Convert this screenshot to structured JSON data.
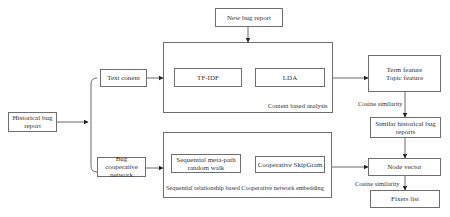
{
  "diagram": {
    "nodes": {
      "new_bug_report": "New bug report",
      "historical_bug_report": "Historical bug report",
      "text_content": "Text conent",
      "bug_cooperative_network": "Bug cooperative network",
      "tf_idf": "TF-IDF",
      "lda": "LDA",
      "sequential_meta_path": "Sequential meta-path random walk",
      "cooperative_skipgram": "Cooperative SkipGram",
      "term_feature": "Term feature",
      "topic_feature": "Topic feature",
      "similar_historical_bug_reports": "Similar historical bug reports",
      "node_vector": "Node vector",
      "fixers_list": "Fixers list"
    },
    "groups": {
      "content_based_analysis": "Content based analysis",
      "sequential_embedding": "Sequential relationship based Cooperative network embedding"
    },
    "edge_labels": {
      "cosine_similarity_1": "Cosine similarity",
      "cosine_similarity_2": "Cosine similarity"
    },
    "edges": [
      {
        "from": "new_bug_report",
        "to": "content_based_analysis"
      },
      {
        "from": "historical_bug_report",
        "to": "text_content"
      },
      {
        "from": "historical_bug_report",
        "to": "bug_cooperative_network"
      },
      {
        "from": "text_content",
        "to": "content_based_analysis"
      },
      {
        "from": "bug_cooperative_network",
        "to": "sequential_embedding"
      },
      {
        "from": "content_based_analysis",
        "to": "term_topic_feature"
      },
      {
        "from": "term_topic_feature",
        "to": "similar_historical_bug_reports",
        "label": "Cosine similarity"
      },
      {
        "from": "similar_historical_bug_reports",
        "to": "node_vector"
      },
      {
        "from": "sequential_embedding",
        "to": "node_vector"
      },
      {
        "from": "node_vector",
        "to": "fixers_list",
        "label": "Cosine similarity"
      }
    ]
  }
}
